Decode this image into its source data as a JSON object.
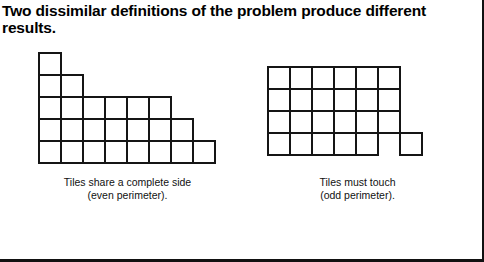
{
  "page": {
    "title_line_1": "Two dissimilar definitions of the problem produce different",
    "title_line_2": "results.",
    "title": "Two dissimilar definitions of the problem produce different\nresults.",
    "background_color": "#ffffff",
    "ink_color": "#000000",
    "frame": {
      "right_rule": true,
      "bottom_rule": true,
      "rule_color": "#111111"
    }
  },
  "figures": [
    {
      "id": "even-perimeter",
      "name": "tiles-share-complete-side",
      "caption_line_1": "Tiles share a complete side",
      "caption_line_2": "(even perimeter).",
      "caption": "Tiles share a complete side\n(even perimeter).",
      "tile_size_px": 24,
      "origin": {
        "x": 18,
        "y": 4
      },
      "row_counts": [
        1,
        2,
        6,
        7,
        8
      ],
      "total_tiles": 24,
      "tiles": [
        {
          "row": 0,
          "col": 0
        },
        {
          "row": 1,
          "col": 0
        },
        {
          "row": 1,
          "col": 1
        },
        {
          "row": 2,
          "col": 0
        },
        {
          "row": 2,
          "col": 1
        },
        {
          "row": 2,
          "col": 2
        },
        {
          "row": 2,
          "col": 3
        },
        {
          "row": 2,
          "col": 4
        },
        {
          "row": 2,
          "col": 5
        },
        {
          "row": 3,
          "col": 0
        },
        {
          "row": 3,
          "col": 1
        },
        {
          "row": 3,
          "col": 2
        },
        {
          "row": 3,
          "col": 3
        },
        {
          "row": 3,
          "col": 4
        },
        {
          "row": 3,
          "col": 5
        },
        {
          "row": 3,
          "col": 6
        },
        {
          "row": 4,
          "col": 0
        },
        {
          "row": 4,
          "col": 1
        },
        {
          "row": 4,
          "col": 2
        },
        {
          "row": 4,
          "col": 3
        },
        {
          "row": 4,
          "col": 4
        },
        {
          "row": 4,
          "col": 5
        },
        {
          "row": 4,
          "col": 6
        },
        {
          "row": 4,
          "col": 7
        }
      ]
    },
    {
      "id": "odd-perimeter",
      "name": "tiles-must-touch",
      "caption_line_1": "Tiles must touch",
      "caption_line_2": "(odd perimeter).",
      "caption": "Tiles must touch\n(odd perimeter).",
      "tile_size_px": 24,
      "origin": {
        "x": 12,
        "y": 18
      },
      "row_counts": [
        6,
        6,
        6,
        6
      ],
      "total_tiles": 24,
      "tiles": [
        {
          "row": 0,
          "col": 0
        },
        {
          "row": 0,
          "col": 1
        },
        {
          "row": 0,
          "col": 2
        },
        {
          "row": 0,
          "col": 3
        },
        {
          "row": 0,
          "col": 4
        },
        {
          "row": 0,
          "col": 5
        },
        {
          "row": 1,
          "col": 0
        },
        {
          "row": 1,
          "col": 1
        },
        {
          "row": 1,
          "col": 2
        },
        {
          "row": 1,
          "col": 3
        },
        {
          "row": 1,
          "col": 4
        },
        {
          "row": 1,
          "col": 5
        },
        {
          "row": 2,
          "col": 0
        },
        {
          "row": 2,
          "col": 1
        },
        {
          "row": 2,
          "col": 2
        },
        {
          "row": 2,
          "col": 3
        },
        {
          "row": 2,
          "col": 4
        },
        {
          "row": 2,
          "col": 5
        },
        {
          "row": 3,
          "col": 0
        },
        {
          "row": 3,
          "col": 1
        },
        {
          "row": 3,
          "col": 2
        },
        {
          "row": 3,
          "col": 3
        },
        {
          "row": 3,
          "col": 4
        },
        {
          "row": 3,
          "col": 6
        }
      ],
      "detached_tile": {
        "row": 3,
        "col": 6,
        "note": "touches only at a corner"
      }
    }
  ]
}
